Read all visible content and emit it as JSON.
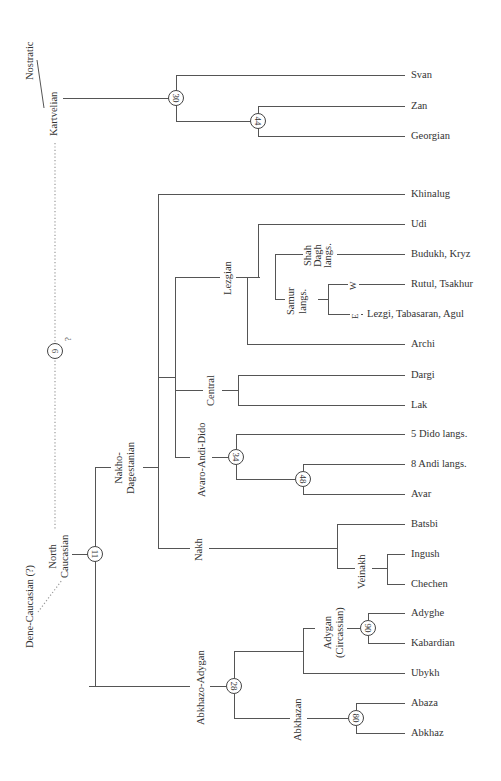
{
  "diagram": {
    "type": "language family tree",
    "root_links": {
      "nostratic": "Nostratic",
      "dene_caucasian": "Dene-Caucasian (?)",
      "question_mark": "?"
    },
    "nodes": {
      "n6": "6",
      "n30": "30",
      "n44": "44",
      "n11": "11",
      "n34": "34",
      "n48": "48",
      "n28": "28",
      "n90": "90",
      "n80": "80"
    },
    "groups": {
      "kartvelian": "Kartvelian",
      "north_caucasian_1": "North",
      "north_caucasian_2": "Caucasian",
      "nakho_dagestanian_1": "Nakho-",
      "nakho_dagestanian_2": "Dagestanian",
      "lezgian": "Lezgian",
      "shah_dagh_1": "Shah",
      "shah_dagh_2": "Dagh",
      "shah_dagh_3": "langs.",
      "samur_1": "Samur",
      "samur_2": "langs.",
      "samur_w": "W",
      "samur_e": "E",
      "central": "Central",
      "avaro_andi_dido": "Avaro-Andi-Dido",
      "nakh": "Nakh",
      "veinakh": "Veinakh",
      "abkhazo_adygan": "Abkhazo-Adygan",
      "adygan_1": "Adygan",
      "adygan_2": "(Circassian)",
      "abkhazan": "Abkhazan"
    },
    "leaves": [
      "Svan",
      "Zan",
      "Georgian",
      "Khinalug",
      "Udi",
      "Budukh, Kryz",
      "Rutul, Tsakhur",
      "Lezgi, Tabasaran, Agul",
      "Archi",
      "Dargi",
      "Lak",
      "5 Dido langs.",
      "8 Andi langs.",
      "Avar",
      "Batsbi",
      "Ingush",
      "Chechen",
      "Adyghe",
      "Kabardian",
      "Ubykh",
      "Abaza",
      "Abkhaz"
    ]
  }
}
